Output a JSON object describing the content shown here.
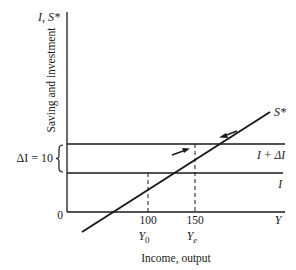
{
  "diagram": {
    "type": "economics-saving-investment",
    "y_axis": {
      "symbol": "I, S*",
      "title": "Saving and investment"
    },
    "x_axis": {
      "symbol": "Y",
      "title": "Income, output",
      "origin_label": "0",
      "ticks": [
        {
          "value": "100",
          "label": "Y",
          "subscript": "0"
        },
        {
          "value": "150",
          "label": "Y",
          "subscript": "e"
        }
      ]
    },
    "lines": {
      "saving": "S*",
      "investment": "I",
      "investment_shifted": "I + ΔI"
    },
    "brace_label": "ΔI = 10",
    "colors": {
      "ink": "#1a1a1a",
      "background": "#ffffff"
    }
  }
}
